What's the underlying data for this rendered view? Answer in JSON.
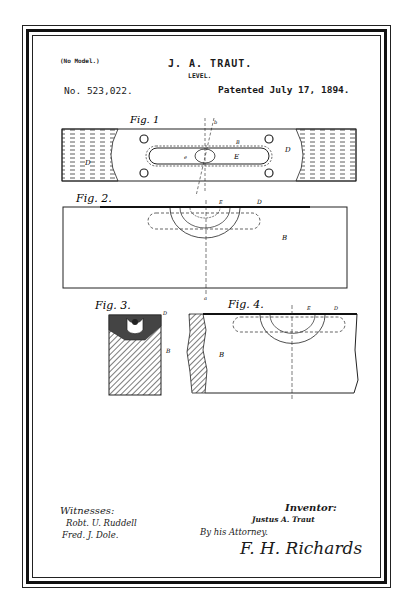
{
  "header": {
    "model_note": "(No Model.)",
    "inventor": "J. A. TRAUT.",
    "title": "LEVEL.",
    "patent_number": "No. 523,022.",
    "patent_date": "Patented July 17, 1894."
  },
  "figures": [
    {
      "label": "Fig. 1",
      "labels": [
        "D",
        "D",
        "E",
        "e",
        "B",
        "b",
        "b'",
        "d"
      ]
    },
    {
      "label": "Fig. 2.",
      "labels": [
        "a",
        "a",
        "B",
        "E",
        "D",
        "B",
        "b'",
        "e"
      ]
    },
    {
      "label": "Fig. 3.",
      "labels": [
        "E",
        "d",
        "D",
        "3",
        "B"
      ]
    },
    {
      "label": "Fig. 4.",
      "labels": [
        "A",
        "B",
        "E",
        "D",
        "e",
        "B"
      ]
    }
  ],
  "fig_text": {
    "fig1": "Fig. 1",
    "fig2": "Fig. 2.",
    "fig3": "Fig. 3.",
    "fig4": "Fig. 4."
  },
  "footer": {
    "witnesses_label": "Witnesses:",
    "witness_1": "Robt. U. Ruddell",
    "witness_2": "Fred. J. Dole.",
    "inventor_label": "Inventor:",
    "inventor_signature": "Justus A. Traut",
    "by_attorney": "By his Attorney.",
    "attorney_signature": "F. H. Richards"
  },
  "colors": {
    "ink": "#1a1a1a",
    "paper": "#ffffff"
  }
}
